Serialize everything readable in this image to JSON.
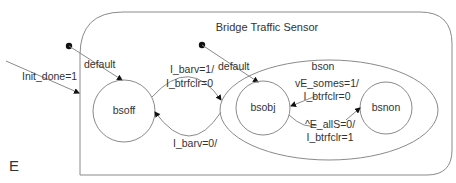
{
  "diagram": {
    "type": "statechart",
    "outer_state": {
      "label": "Bridge Traffic Sensor"
    },
    "superstate": {
      "label": "bson"
    },
    "states": [
      {
        "id": "bsoff",
        "label": "bsoff"
      },
      {
        "id": "bsobj",
        "label": "bsobj"
      },
      {
        "id": "bsnon",
        "label": "bsnon"
      }
    ],
    "transitions": {
      "init_entry": {
        "label": "Init_done=1"
      },
      "default_outer": {
        "label": "default"
      },
      "default_inner": {
        "label": "default"
      },
      "bsoff_to_bson": {
        "line1": "I_barv=1/",
        "line2": "I_btrfclr=0"
      },
      "bson_to_bsoff": {
        "label": "I_barv=0/"
      },
      "bsobj_to_bsnon": {
        "line1": "vE_somes=1/",
        "line2": "I_btrfclr=0"
      },
      "bsnon_to_bsobj": {
        "line1": "^E_allS=0/",
        "line2": "I_btrfclr=1"
      }
    },
    "corner_label": "E",
    "colors": {
      "stroke": "#8a8a8a",
      "text": "#333333",
      "marker": "#111111"
    }
  }
}
